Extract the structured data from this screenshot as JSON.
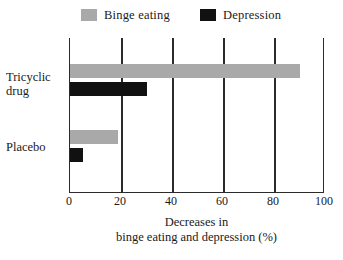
{
  "chart_data": {
    "type": "bar",
    "orientation": "horizontal",
    "title": "",
    "xlabel": "Decreases in\nbinge eating and depression (%)",
    "xlabel_line1": "Decreases in",
    "xlabel_line2": "binge eating and depression (%)",
    "ylabel": "",
    "categories": [
      "Tricyclic drug",
      "Placebo"
    ],
    "category_lines": [
      [
        "Tricyclic",
        "drug"
      ],
      [
        "Placebo"
      ]
    ],
    "series": [
      {
        "name": "Binge eating",
        "color": "#a9a9a9",
        "values": [
          90,
          19
        ]
      },
      {
        "name": "Depression",
        "color": "#111111",
        "values": [
          30,
          5
        ]
      }
    ],
    "xlim": [
      0,
      100
    ],
    "xticks": [
      0,
      20,
      40,
      60,
      80,
      100
    ],
    "xtick_labels": [
      "0",
      "20",
      "40",
      "60",
      "80",
      "100"
    ],
    "grid": "vertical",
    "legend_position": "top"
  },
  "legend": {
    "items": [
      {
        "label": "Binge eating",
        "color": "#a9a9a9"
      },
      {
        "label": "Depression",
        "color": "#111111"
      }
    ]
  },
  "axis": {
    "tick_labels": [
      "0",
      "20",
      "40",
      "60",
      "80",
      "100"
    ],
    "title_line1": "Decreases in",
    "title_line2": "binge eating and depression (%)"
  },
  "categories": {
    "tricyclic_line1": "Tricyclic",
    "tricyclic_line2": "drug",
    "placebo": "Placebo"
  },
  "colors": {
    "binge_eating": "#a9a9a9",
    "depression": "#111111",
    "axis": "#2b2b2b",
    "background": "#ffffff"
  }
}
